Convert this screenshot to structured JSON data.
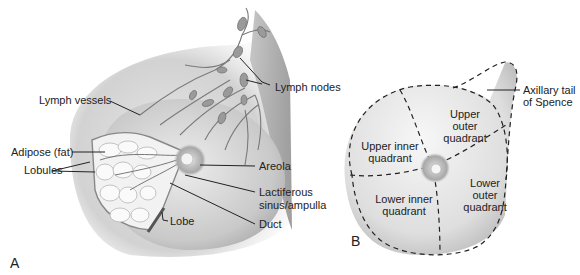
{
  "figure": {
    "panel_a": {
      "letter": "A",
      "labels": {
        "lymph_vessels": "Lymph vessels",
        "lymph_nodes": "Lymph nodes",
        "adipose": "Adipose (fat)",
        "lobules": "Lobules",
        "areola": "Areola",
        "lactiferous_line1": "Lactiferous",
        "lactiferous_line2": "sinus/ampulla",
        "lobe": "Lobe",
        "duct": "Duct"
      }
    },
    "panel_b": {
      "letter": "B",
      "labels": {
        "axillary_line1": "Axillary tail",
        "axillary_line2": "of Spence",
        "uiq_line1": "Upper inner",
        "uiq_line2": "quadrant",
        "uoq_line1": "Upper",
        "uoq_line2": "outer",
        "uoq_line3": "quadrant",
        "liq_line1": "Lower inner",
        "liq_line2": "quadrant",
        "loq_line1": "Lower",
        "loq_line2": "outer",
        "loq_line3": "quadrant"
      }
    }
  }
}
